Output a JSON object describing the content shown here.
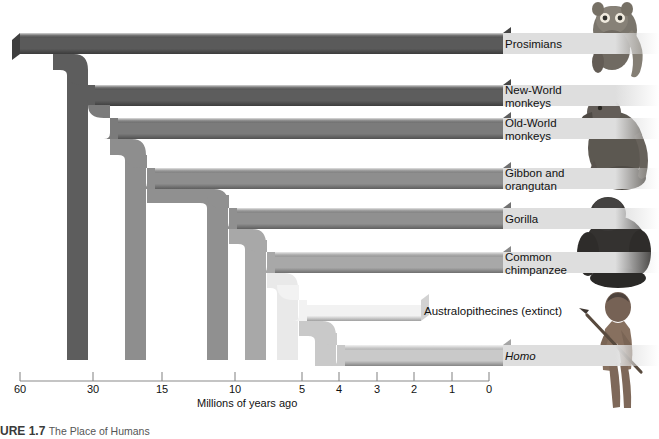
{
  "figure": {
    "caption_number": "URE 1.7",
    "caption_text": "The Place of Humans",
    "axis_title": "Millions of years ago"
  },
  "axis": {
    "ticks": [
      {
        "label": "60",
        "value": 60,
        "x": 20
      },
      {
        "label": "30",
        "value": 30,
        "x": 93
      },
      {
        "label": "15",
        "value": 15,
        "x": 162
      },
      {
        "label": "10",
        "value": 10,
        "x": 235
      },
      {
        "label": "5",
        "value": 5,
        "x": 302
      },
      {
        "label": "4",
        "value": 4,
        "x": 339
      },
      {
        "label": "3",
        "value": 3,
        "x": 377
      },
      {
        "label": "2",
        "value": 2,
        "x": 414
      },
      {
        "label": "1",
        "value": 1,
        "x": 452
      },
      {
        "label": "0",
        "value": 0,
        "x": 489
      }
    ],
    "line_y": 381,
    "tick_top": 372,
    "label_y": 383
  },
  "taxa": [
    {
      "name": "Prosimians",
      "line1": "Prosimians",
      "line2": "",
      "band_y": 33,
      "band_h": 21,
      "label_x": 505,
      "label_y": 38,
      "italic": false,
      "divergence_mya": 60,
      "branch_color": "#5a5a5a"
    },
    {
      "name": "New-World monkeys",
      "line1": "New-World",
      "line2": "monkeys",
      "band_y": 85,
      "band_h": 21,
      "label_x": 505,
      "label_y": 84,
      "italic": false,
      "divergence_mya": 37,
      "branch_color": "#5d5d5d"
    },
    {
      "name": "Old-World monkeys",
      "line1": "Old-World",
      "line2": "monkeys",
      "band_y": 118,
      "band_h": 21,
      "label_x": 505,
      "label_y": 117,
      "italic": false,
      "divergence_mya": 30,
      "branch_color": "#7b7b7b"
    },
    {
      "name": "Gibbon and orangutan",
      "line1": "Gibbon and",
      "line2": "orangutan",
      "band_y": 168,
      "band_h": 21,
      "label_x": 505,
      "label_y": 167,
      "italic": false,
      "divergence_mya": 19,
      "branch_color": "#8e8e8e"
    },
    {
      "name": "Gorilla",
      "line1": "Gorilla",
      "line2": "",
      "band_y": 208,
      "band_h": 21,
      "label_x": 505,
      "label_y": 213,
      "italic": false,
      "divergence_mya": 11,
      "branch_color": "#909090"
    },
    {
      "name": "Common chimpanzee",
      "line1": "Common",
      "line2": "chimpanzee",
      "band_y": 252,
      "band_h": 21,
      "label_x": 505,
      "label_y": 251,
      "italic": false,
      "divergence_mya": 8,
      "branch_color": "#a8a8a8"
    },
    {
      "name": "Australopithecines",
      "line1": "Australopithecines (extinct)",
      "line2": "",
      "band_y": 300,
      "band_h": 21,
      "label_x": 424,
      "label_y": 305,
      "italic": false,
      "divergence_mya": 6,
      "branch_color": "#f2f2f2"
    },
    {
      "name": "Homo",
      "line1": "Homo",
      "line2": "",
      "band_y": 345,
      "band_h": 21,
      "label_x": 505,
      "label_y": 350,
      "italic": true,
      "divergence_mya": 4,
      "branch_color": "#c9c9c9"
    }
  ],
  "illustrations": [
    {
      "name": "prosimian-lemur-photo",
      "x": 575,
      "y": 4,
      "w": 82,
      "h": 78
    },
    {
      "name": "old-world-monkey-photo",
      "x": 575,
      "y": 88,
      "w": 82,
      "h": 98
    },
    {
      "name": "gorilla-photo",
      "x": 575,
      "y": 188,
      "w": 82,
      "h": 98
    },
    {
      "name": "hominid-photo",
      "x": 575,
      "y": 288,
      "w": 82,
      "h": 140
    }
  ],
  "colors": {
    "band": "#dedede",
    "background": "#ffffff",
    "axis_line": "#8a8a8a",
    "text": "#111111"
  }
}
